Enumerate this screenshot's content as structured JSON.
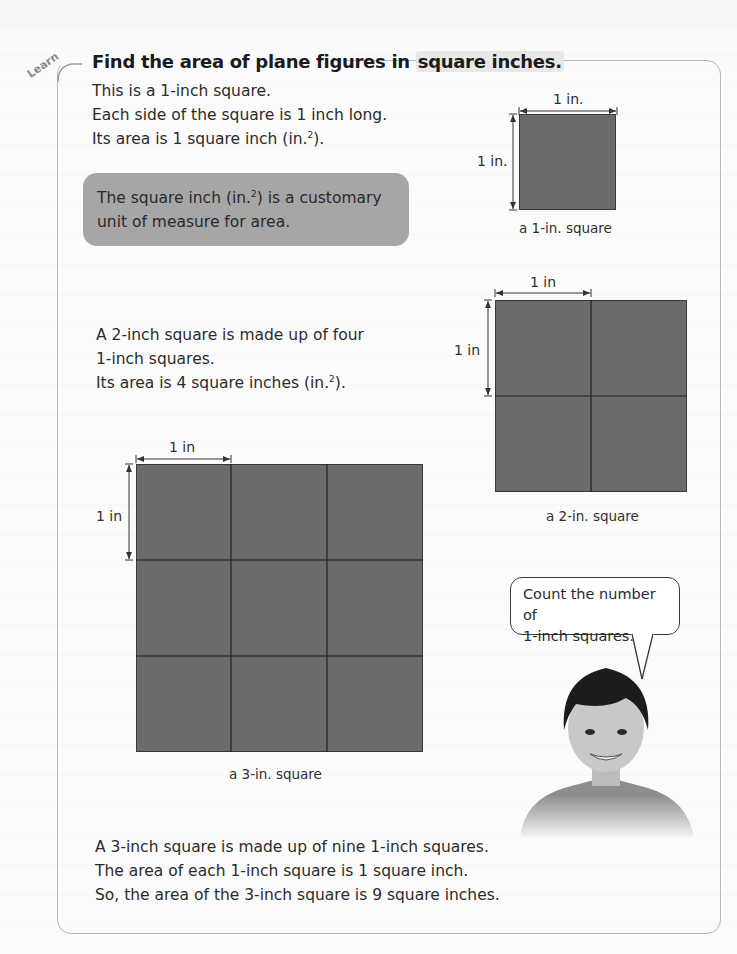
{
  "header": {
    "badge": "Learn",
    "title_part1": "Find the area of plane figures in ",
    "title_highlight": "square inches."
  },
  "intro": {
    "line1": "This is a 1-inch square.",
    "line2": "Each side of the square is 1 inch long.",
    "line3_pre": "Its area is 1 square inch (in.",
    "line3_sup": "2",
    "line3_post": ")."
  },
  "note": {
    "line1_pre": "The square inch (in.",
    "line1_sup": "2",
    "line1_post": ") is a customary",
    "line2": "unit of measure for area."
  },
  "figures": {
    "one_inch": {
      "top_label": "1 in.",
      "side_label": "1 in.",
      "caption": "a 1-in. square",
      "cells": 1
    },
    "two_inch": {
      "top_label": "1 in",
      "side_label": "1 in",
      "caption": "a 2-in. square",
      "cells": 4
    },
    "three_inch": {
      "top_label": "1 in",
      "side_label": "1 in",
      "caption": "a 3-in. square",
      "cells": 9
    }
  },
  "two_inch_text": {
    "line1": "A 2-inch square is made up of four",
    "line2": "1-inch squares.",
    "line3_pre": "Its area is 4 square inches (in.",
    "line3_sup": "2",
    "line3_post": ")."
  },
  "speech_bubble": {
    "line1": "Count the number of",
    "line2": "1-inch squares."
  },
  "conclusion": {
    "line1": "A 3-inch square is made up of nine 1-inch squares.",
    "line2": "The area of each 1-inch square is 1 square inch.",
    "line3": "So, the area of the 3-inch square is 9 square inches."
  },
  "colors": {
    "square_fill": "#6b6b6b",
    "note_fill": "#a6a6a6",
    "frame_border": "#b9b9b9"
  }
}
